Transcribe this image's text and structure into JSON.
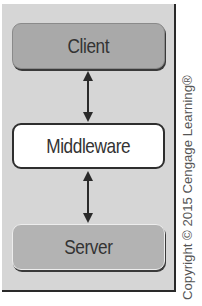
{
  "diagram": {
    "nodes": [
      {
        "id": "client",
        "label": "Client",
        "fill": "#a9a9a9"
      },
      {
        "id": "middleware",
        "label": "Middleware",
        "fill": "#ffffff"
      },
      {
        "id": "server",
        "label": "Server",
        "fill": "#b3b3b3"
      }
    ],
    "edges": [
      {
        "from": "client",
        "to": "middleware",
        "type": "bidirectional"
      },
      {
        "from": "middleware",
        "to": "server",
        "type": "bidirectional"
      }
    ],
    "panel_color": "#d6d6d6"
  },
  "copyright": "Copyright © 2015 Cengage Learning®"
}
